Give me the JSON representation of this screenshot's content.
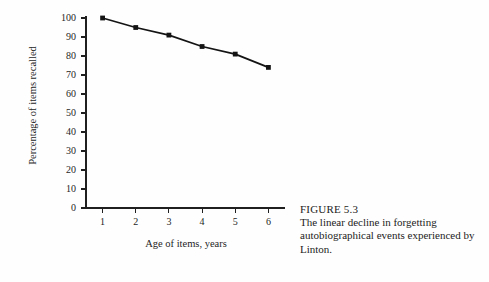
{
  "figure": {
    "caption_title": "FIGURE 5.3",
    "caption_body": "The linear decline in forgetting autobiographical events experienced by Linton."
  },
  "chart_data": {
    "type": "line",
    "title": "",
    "xlabel": "Age of items, years",
    "ylabel": "Percentage of items recalled",
    "x": [
      1,
      2,
      3,
      4,
      5,
      6
    ],
    "values": [
      100,
      95,
      91,
      85,
      81,
      74
    ],
    "xtick_labels": [
      "1",
      "2",
      "3",
      "4",
      "5",
      "6"
    ],
    "ytick_labels": [
      "0",
      "10",
      "20",
      "30",
      "40",
      "50",
      "60",
      "70",
      "80",
      "90",
      "100"
    ],
    "ytick_values": [
      0,
      10,
      20,
      30,
      40,
      50,
      60,
      70,
      80,
      90,
      100
    ],
    "xlim": [
      0.5,
      6.5
    ],
    "ylim": [
      0,
      100
    ],
    "grid": false,
    "legend": false,
    "marker": "square",
    "line_color": "#141414",
    "axis_color": "#1f1f1f",
    "background_color": "#fefefe"
  }
}
